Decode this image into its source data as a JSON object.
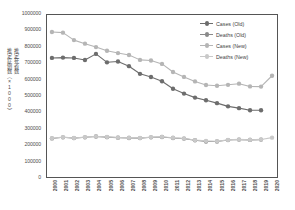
{
  "chart_data": {
    "type": "line",
    "title": "",
    "xlabel": "",
    "ylabel": "推定死者数 推定症例数（×1000）",
    "ylabel_col1": "推定死者数",
    "ylabel_col2": "推定症例数（×1000）",
    "ylim": [
      0,
      1000000
    ],
    "ytick_step": 100000,
    "ytick_labels": [
      "1000000",
      "900000",
      "800000",
      "700000",
      "600000",
      "500000",
      "400000",
      "300000",
      "200000",
      "100000",
      "0"
    ],
    "ytick_values": [
      1000000,
      900000,
      800000,
      700000,
      600000,
      500000,
      400000,
      300000,
      200000,
      100000,
      0
    ],
    "grid": false,
    "legend_position": "top-right",
    "categories": [
      "2000",
      "2001",
      "2002",
      "2003",
      "2004",
      "2005",
      "2006",
      "2007",
      "2008",
      "2009",
      "2010",
      "2011",
      "2012",
      "2013",
      "2014",
      "2015",
      "2016",
      "2017",
      "2018",
      "2019",
      "2020"
    ],
    "x": [
      2000,
      2001,
      2002,
      2003,
      2004,
      2005,
      2006,
      2007,
      2008,
      2009,
      2010,
      2011,
      2012,
      2013,
      2014,
      2015,
      2016,
      2017,
      2018,
      2019,
      2020
    ],
    "series": [
      {
        "name": "Cases (Old)",
        "color": "#6d6d6d",
        "values": [
          735000,
          737000,
          735000,
          722000,
          760000,
          708000,
          713000,
          684000,
          637000,
          617000,
          591000,
          545000,
          515000,
          490000,
          474000,
          456000,
          436000,
          425000,
          412000,
          412000,
          null
        ]
      },
      {
        "name": "Deaths (Old)",
        "color": "#8a8a8a",
        "values": [
          238000,
          245000,
          240000,
          245000,
          250000,
          246000,
          243000,
          241000,
          240000,
          245000,
          247000,
          241000,
          237000,
          227000,
          219000,
          219000,
          228000,
          231000,
          229000,
          231000,
          null
        ]
      },
      {
        "name": "Cases (New)",
        "color": "#b5b5b5",
        "values": [
          895000,
          891000,
          845000,
          823000,
          802000,
          779000,
          765000,
          753000,
          723000,
          719000,
          698000,
          648000,
          618000,
          590000,
          568000,
          563000,
          569000,
          576000,
          559000,
          558000,
          625000
        ]
      },
      {
        "name": "Deaths (New)",
        "color": "#c9c9c9",
        "values": [
          239000,
          246000,
          241000,
          246000,
          251000,
          247000,
          244000,
          242000,
          241000,
          246000,
          248000,
          242000,
          238000,
          228000,
          223000,
          221000,
          229000,
          232000,
          230000,
          232000,
          243000
        ]
      }
    ]
  },
  "legend": {
    "items": [
      {
        "label": "Cases (Old)"
      },
      {
        "label": "Deaths (Old)"
      },
      {
        "label": "Cases (New)"
      },
      {
        "label": "Deaths (New)"
      }
    ]
  }
}
